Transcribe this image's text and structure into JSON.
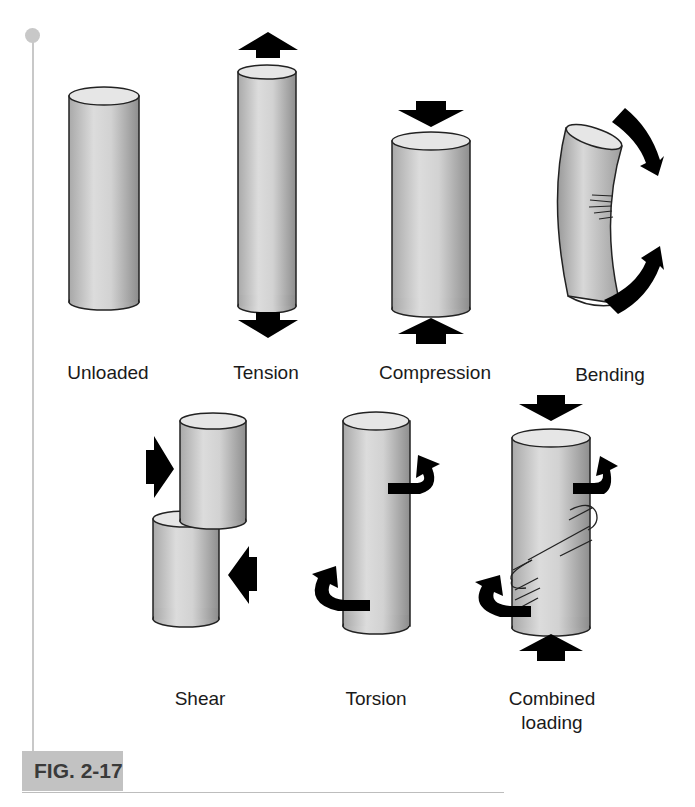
{
  "figure": {
    "tag": "FIG. 2-17",
    "panels": [
      {
        "id": "unloaded",
        "label": "Unloaded"
      },
      {
        "id": "tension",
        "label": "Tension"
      },
      {
        "id": "compression",
        "label": "Compression"
      },
      {
        "id": "bending",
        "label": "Bending"
      },
      {
        "id": "shear",
        "label": "Shear"
      },
      {
        "id": "torsion",
        "label": "Torsion"
      },
      {
        "id": "combined",
        "label_line1": "Combined",
        "label_line2": "loading"
      }
    ]
  },
  "colors": {
    "cylinder_light": "#e4e4e4",
    "cylinder_mid": "#bdbdbd",
    "cylinder_dark": "#8f8f8f",
    "arrow": "#000000",
    "rule": "#c8c8c8",
    "tag_bg": "#c2c2c2"
  }
}
